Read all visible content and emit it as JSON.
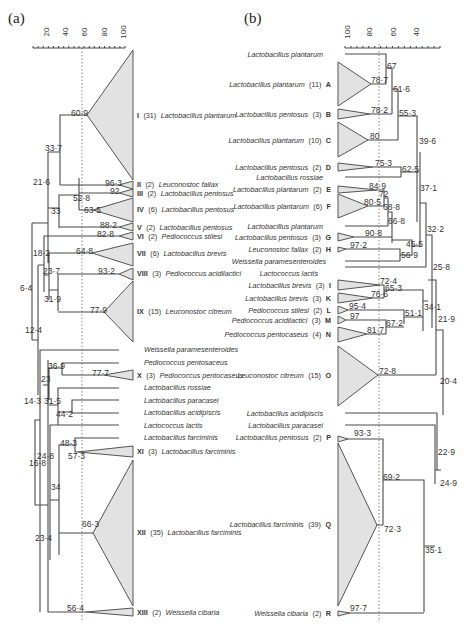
{
  "figure": {
    "panel_a_label": "(a)",
    "panel_b_label": "(b)"
  },
  "panel_a": {
    "axis": {
      "ticks": [
        "20",
        "40",
        "60",
        "80",
        "100"
      ],
      "cutoff_line": 60
    },
    "clusters": [
      {
        "numeral": "I",
        "count": "(31)",
        "name": "Lactobacillus plantarum",
        "node": "60·9"
      },
      {
        "numeral": "II",
        "count": "(2)",
        "name": "Leuconostoc fallax",
        "node": "96·3"
      },
      {
        "numeral": "III",
        "count": "(2)",
        "name": "Lactobacillus pentosus",
        "node": "92"
      },
      {
        "numeral": "IV",
        "count": "(6)",
        "name": "Lactobacillus pentosus",
        "node": "63·5"
      },
      {
        "numeral": "V",
        "count": "(2)",
        "name": "Lactobacillus pentosus",
        "node": "88·2"
      },
      {
        "numeral": "VI",
        "count": "(2)",
        "name": "Pediococcus stilesi",
        "node": "82·8"
      },
      {
        "numeral": "VII",
        "count": "(6)",
        "name": "Lactobacillus brevis",
        "node": "64·8"
      },
      {
        "numeral": "VIII",
        "count": "(3)",
        "name": "Pediococcus acidilactici",
        "node": "93·2"
      },
      {
        "numeral": "IX",
        "count": "(15)",
        "name": "Leuconostoc citreum",
        "node": "77·9"
      },
      {
        "numeral": "",
        "count": "",
        "name": "Weissella paramesenteroides",
        "node": ""
      },
      {
        "numeral": "",
        "count": "",
        "name": "Pediococcus pentosaceus",
        "node": ""
      },
      {
        "numeral": "X",
        "count": "(3)",
        "name": "Pediococcus pentocaseus",
        "node": "77·7"
      },
      {
        "numeral": "",
        "count": "",
        "name": "Lactobacillus rossiae",
        "node": ""
      },
      {
        "numeral": "",
        "count": "",
        "name": "Lactobacillus paracasei",
        "node": ""
      },
      {
        "numeral": "",
        "count": "",
        "name": "Lactobacillus acidipiscis",
        "node": ""
      },
      {
        "numeral": "",
        "count": "",
        "name": "Lactococcus lactis",
        "node": ""
      },
      {
        "numeral": "",
        "count": "",
        "name": "Lactobacillus farciminis",
        "node": ""
      },
      {
        "numeral": "XI",
        "count": "(3)",
        "name": "Lactobacillus farciminis",
        "node": "57·3"
      },
      {
        "numeral": "XII",
        "count": "(35)",
        "name": "Lactobacillus farciminis",
        "node": "66·3"
      },
      {
        "numeral": "XIII",
        "count": "(2)",
        "name": "Weissella cibaria",
        "node": "56·4"
      }
    ],
    "internal_nodes": [
      "33·7",
      "21·6",
      "52·8",
      "33",
      "18·2",
      "23·7",
      "31·9",
      "6·4",
      "12·4",
      "36·9",
      "23",
      "31·5",
      "44·2",
      "14·3",
      "48·3",
      "24·8",
      "16·8",
      "34",
      "23·4"
    ]
  },
  "panel_b": {
    "axis": {
      "ticks": [
        "100",
        "80",
        "60",
        "40"
      ],
      "cutoff_line": 80
    },
    "leaves": [
      {
        "name": "Lactobacillus plantarum",
        "count": "",
        "letter": "",
        "node": ""
      },
      {
        "name": "Lactobacillus plantarum",
        "count": "(11)",
        "letter": "A",
        "node": "78·7"
      },
      {
        "name": "Lactobacillus pentosus",
        "count": "(3)",
        "letter": "B",
        "node": "78·2"
      },
      {
        "name": "Lactobacillus plantarum",
        "count": "(10)",
        "letter": "C",
        "node": "80"
      },
      {
        "name": "Lactobacillus pentosus",
        "count": "(2)",
        "letter": "D",
        "node": "75·3"
      },
      {
        "name": "Lactobacillus rossiae",
        "count": "",
        "letter": "",
        "node": ""
      },
      {
        "name": "Lactobacillus plantarum",
        "count": "(2)",
        "letter": "E",
        "node": "84·9"
      },
      {
        "name": "Lactobacillus plantarum",
        "count": "(6)",
        "letter": "F",
        "node": "80·5"
      },
      {
        "name": "Lactobacillus plantarum",
        "count": "",
        "letter": "",
        "node": ""
      },
      {
        "name": "Lactobacillus pentosus",
        "count": "(3)",
        "letter": "G",
        "node": "90·8"
      },
      {
        "name": "Leuconostoc fallax",
        "count": "(2)",
        "letter": "H",
        "node": "97·2"
      },
      {
        "name": "Weissella paramesenteroides",
        "count": "",
        "letter": "",
        "node": ""
      },
      {
        "name": "Lactococcus lactis",
        "count": "",
        "letter": "",
        "node": ""
      },
      {
        "name": "Lactobacillus brevis",
        "count": "(3)",
        "letter": "I",
        "node": "72·4"
      },
      {
        "name": "Lactobacillus brevis",
        "count": "(3)",
        "letter": "K",
        "node": "76·6"
      },
      {
        "name": "Pediococcus stilesi",
        "count": "(2)",
        "letter": "L",
        "node": "95·4"
      },
      {
        "name": "Pediococcus acidilactici",
        "count": "(3)",
        "letter": "M",
        "node": "97"
      },
      {
        "name": "Pediococcus pentocaseus",
        "count": "(4)",
        "letter": "N",
        "node": "81·7"
      },
      {
        "name": "Leuconostoc citreum",
        "count": "(15)",
        "letter": "O",
        "node": "72·8"
      },
      {
        "name": "Lactobacillus acidipiscis",
        "count": "",
        "letter": "",
        "node": ""
      },
      {
        "name": "Lactobacillus paracasei",
        "count": "",
        "letter": "",
        "node": ""
      },
      {
        "name": "Lactobacillus pentosus",
        "count": "(2)",
        "letter": "P",
        "node": "93·3"
      },
      {
        "name": "Lactobacillus farciminis",
        "count": "(39)",
        "letter": "Q",
        "node": "72·3"
      },
      {
        "name": "Weissella cibaria",
        "count": "(2)",
        "letter": "R",
        "node": "97·7"
      }
    ],
    "internal_nodes": [
      "67",
      "61·6",
      "55·3",
      "39·6",
      "62·5",
      "72",
      "68·8",
      "66·8",
      "45·5",
      "56·9",
      "37·1",
      "32·2",
      "25·8",
      "65·3",
      "51·1",
      "67·2",
      "34·1",
      "21·9",
      "20·4",
      "69·2",
      "22·9",
      "24·9",
      "35·1"
    ]
  }
}
